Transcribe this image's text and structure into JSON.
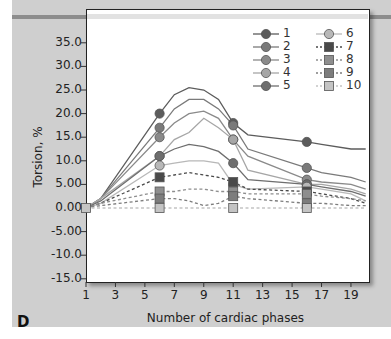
{
  "panel_label": "D",
  "chart_data": {
    "type": "line",
    "title": "",
    "xlabel": "Number of cardiac phases",
    "ylabel": "Torsion, %",
    "xlim": [
      1,
      20
    ],
    "ylim": [
      -15,
      40
    ],
    "x_ticks": [
      "1",
      "3",
      "5",
      "7",
      "9",
      "11",
      "13",
      "15",
      "17",
      "19"
    ],
    "y_ticks": [
      "35.0",
      "30.0",
      "25.0",
      "20.0",
      "15.0",
      "10.0",
      "5.00",
      "0.00",
      "-5.00",
      "-10.0",
      "-15.0"
    ],
    "grid": false,
    "legend_position": "upper right",
    "marker_x": [
      1,
      6,
      11,
      16
    ],
    "x": [
      1,
      2,
      6,
      7,
      8,
      9,
      10,
      11,
      12,
      16,
      17,
      19,
      20
    ],
    "series": [
      {
        "name": "1",
        "marker": "circle",
        "style": "solid",
        "color": "#5c5c5c",
        "values": [
          0,
          2,
          20,
          24,
          25.5,
          25,
          23,
          18,
          15.5,
          14,
          13.5,
          12.5,
          12.5
        ]
      },
      {
        "name": "2",
        "marker": "circle",
        "style": "solid",
        "color": "#7a7a7a",
        "values": [
          0,
          2,
          17,
          21,
          23,
          23,
          21,
          17.5,
          12.5,
          8.5,
          7.5,
          6.5,
          5.5
        ]
      },
      {
        "name": "3",
        "marker": "circle",
        "style": "solid",
        "color": "#8a8a8a",
        "values": [
          0,
          2,
          15,
          18,
          20,
          20.5,
          19,
          14.5,
          11,
          6,
          5.5,
          5,
          4
        ]
      },
      {
        "name": "4",
        "marker": "circle",
        "style": "solid",
        "color": "#a6a6a6",
        "values": [
          0,
          2,
          11,
          14.5,
          16,
          19,
          17,
          14.5,
          8,
          5,
          5,
          4,
          3
        ]
      },
      {
        "name": "5",
        "marker": "circle",
        "style": "solid",
        "color": "#6e6e6e",
        "values": [
          0,
          1.5,
          11,
          12.5,
          13.5,
          13,
          12,
          9.5,
          6,
          5,
          4.5,
          3.5,
          2.5
        ]
      },
      {
        "name": "6",
        "marker": "circle",
        "style": "solid",
        "color": "#b8b8b8",
        "values": [
          0,
          1,
          9,
          9.5,
          10,
          10,
          9.5,
          5,
          4,
          4.5,
          4,
          3,
          1.5
        ]
      },
      {
        "name": "7",
        "marker": "square",
        "style": "dashed",
        "color": "#4a4a4a",
        "values": [
          0,
          1,
          6.5,
          7,
          7.5,
          7,
          6.5,
          5.5,
          4,
          3.5,
          3,
          2,
          1
        ]
      },
      {
        "name": "8",
        "marker": "square",
        "style": "dashed",
        "color": "#8e8e8e",
        "values": [
          0,
          1,
          3.5,
          3.5,
          4,
          4,
          3.5,
          3.5,
          3,
          3,
          2.5,
          2,
          1.5
        ]
      },
      {
        "name": "9",
        "marker": "square",
        "style": "dashed",
        "color": "#7d7d7d",
        "values": [
          0,
          0.5,
          2,
          2,
          1.5,
          0.5,
          1,
          2.5,
          2,
          1,
          1,
          0.5,
          0.5
        ]
      },
      {
        "name": "10",
        "marker": "square",
        "style": "dashed",
        "color": "#c4c4c4",
        "values": [
          0,
          0,
          0,
          0,
          0,
          0,
          0,
          0,
          0,
          0,
          0,
          0,
          0
        ]
      }
    ]
  }
}
